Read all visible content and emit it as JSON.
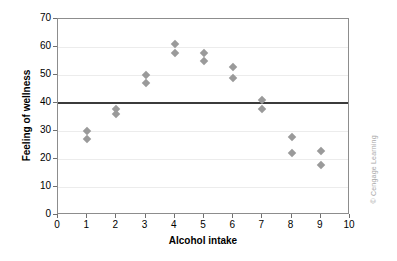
{
  "chart_data": {
    "type": "scatter",
    "title": "",
    "xlabel": "Alcohol intake",
    "ylabel": "Feeling of wellness",
    "xlim": [
      0,
      10
    ],
    "ylim": [
      0,
      70
    ],
    "xticks": [
      0,
      1,
      2,
      3,
      4,
      5,
      6,
      7,
      8,
      9,
      10
    ],
    "yticks": [
      0,
      10,
      20,
      30,
      40,
      50,
      60,
      70
    ],
    "grid": "horizontal",
    "legend": "none",
    "marker": "diamond",
    "marker_color": "#9a9a9a",
    "reference_line": {
      "orientation": "horizontal",
      "value": 40,
      "color": "#3b3b3b"
    },
    "points": [
      {
        "x": 1,
        "y": 30
      },
      {
        "x": 1,
        "y": 27
      },
      {
        "x": 2,
        "y": 38
      },
      {
        "x": 2,
        "y": 36
      },
      {
        "x": 3,
        "y": 50
      },
      {
        "x": 3,
        "y": 47
      },
      {
        "x": 4,
        "y": 61
      },
      {
        "x": 4,
        "y": 58
      },
      {
        "x": 5,
        "y": 58
      },
      {
        "x": 5,
        "y": 55
      },
      {
        "x": 6,
        "y": 53
      },
      {
        "x": 6,
        "y": 49
      },
      {
        "x": 7,
        "y": 41
      },
      {
        "x": 7,
        "y": 38
      },
      {
        "x": 8,
        "y": 28
      },
      {
        "x": 8,
        "y": 22
      },
      {
        "x": 9,
        "y": 23
      },
      {
        "x": 9,
        "y": 18
      }
    ]
  },
  "credit": "© Cengage Learning"
}
